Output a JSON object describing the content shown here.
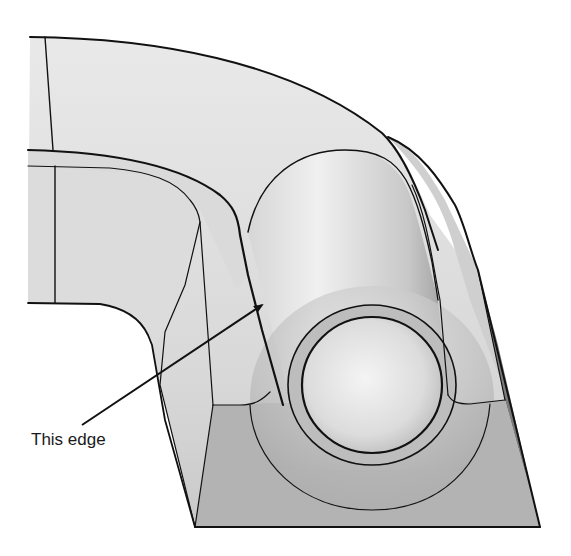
{
  "figure": {
    "colors": {
      "background": "#ffffff",
      "surface_light": "#e4e4e4",
      "surface_mid": "#cfcfcf",
      "surface_dark_face": "#b3b3b3",
      "side_dark": "#7a7a7a",
      "edge_line": "#111111"
    }
  },
  "annotation": {
    "label": "This edge",
    "arrow": {
      "from": [
        82,
        425
      ],
      "to": [
        262,
        305
      ]
    }
  }
}
